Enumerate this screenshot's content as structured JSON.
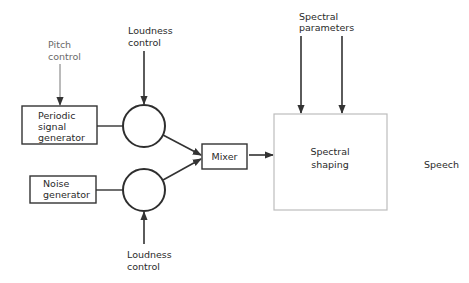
{
  "diagram": {
    "title": "",
    "nodes": {
      "periodic": {
        "lines": [
          "Periodic",
          "signal",
          "generator"
        ]
      },
      "noise": {
        "lines": [
          "Noise",
          "generator"
        ]
      },
      "mixer": {
        "label": "Mixer"
      },
      "spectral_shaping": {
        "lines": [
          "Spectral",
          "shaping"
        ]
      },
      "speech": {
        "label": "Speech"
      }
    },
    "inputs": {
      "pitch_control": {
        "lines": [
          "Pitch",
          "control"
        ]
      },
      "loudness_top": {
        "lines": [
          "Loudness",
          "control"
        ]
      },
      "loudness_bottom": {
        "lines": [
          "Loudness",
          "control"
        ]
      },
      "spectral_parameters": {
        "lines": [
          "Spectral",
          "parameters"
        ]
      }
    },
    "edges": [
      {
        "from": "pitch_control",
        "to": "periodic"
      },
      {
        "from": "periodic",
        "to": "loudness_amp_top"
      },
      {
        "from": "loudness_top",
        "to": "loudness_amp_top"
      },
      {
        "from": "noise",
        "to": "loudness_amp_bottom"
      },
      {
        "from": "loudness_bottom",
        "to": "loudness_amp_bottom"
      },
      {
        "from": "loudness_amp_top",
        "to": "mixer"
      },
      {
        "from": "loudness_amp_bottom",
        "to": "mixer"
      },
      {
        "from": "mixer",
        "to": "spectral_shaping"
      },
      {
        "from": "spectral_parameters",
        "to": "spectral_shaping"
      },
      {
        "from": "spectral_parameters",
        "to": "spectral_shaping"
      }
    ],
    "colors": {
      "stroke": "#333333",
      "light_border": "#bdbdbd",
      "gray_text": "#6a6a6a"
    }
  }
}
